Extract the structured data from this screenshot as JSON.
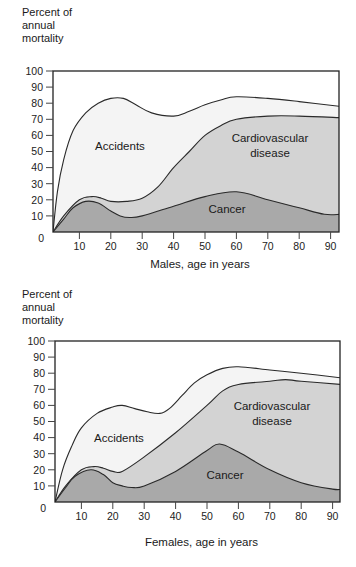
{
  "chart_data": [
    {
      "type": "area",
      "title": "",
      "ylabel": "Percent of annual mortality",
      "xlabel": "Males, age in years",
      "ylim": [
        0,
        100
      ],
      "xlim": [
        0,
        93
      ],
      "yticks": [
        0,
        10,
        20,
        30,
        40,
        50,
        60,
        70,
        80,
        90,
        100
      ],
      "xticks": [
        10,
        20,
        30,
        40,
        50,
        60,
        70,
        80,
        90
      ],
      "grid": false,
      "stacked": true,
      "colors": {
        "accidents": "#f4f4f4",
        "cardiovascular": "#d3d3d3",
        "cancer": "#a9a9a9",
        "line": "#2a2a2a"
      },
      "series": [
        {
          "name": "Accidents",
          "label_lines": [
            "Accidents"
          ],
          "x": [
            1.6,
            3,
            5,
            8,
            12,
            16,
            20,
            24,
            28,
            33,
            40,
            45,
            50,
            55,
            60,
            70,
            80,
            93
          ],
          "values": [
            0,
            25,
            45,
            63,
            74,
            80,
            83,
            83,
            79,
            74,
            72,
            75,
            79,
            82,
            84,
            83,
            81,
            78
          ]
        },
        {
          "name": "Cardiovascular disease",
          "label_lines": [
            "Cardiovascular",
            "disease"
          ],
          "x": [
            1.6,
            5,
            10,
            14,
            17,
            20,
            25,
            30,
            35,
            40,
            45,
            50,
            55,
            60,
            70,
            80,
            93
          ],
          "values": [
            0,
            10,
            20,
            22,
            21,
            19,
            19,
            21,
            28,
            40,
            50,
            60,
            66,
            70,
            72,
            72,
            71
          ]
        },
        {
          "name": "Cancer",
          "label_lines": [
            "Cancer"
          ],
          "x": [
            1.6,
            5,
            8,
            12,
            16,
            20,
            23,
            26,
            30,
            40,
            50,
            60,
            70,
            80,
            88,
            93
          ],
          "values": [
            0,
            8,
            15,
            19,
            18,
            13,
            10,
            9,
            10,
            16,
            22,
            25,
            20,
            15,
            11,
            11
          ]
        }
      ]
    },
    {
      "type": "area",
      "title": "",
      "ylabel": "Percent of annual mortality",
      "xlabel": "Females, age in years",
      "ylim": [
        0,
        100
      ],
      "xlim": [
        0,
        93
      ],
      "yticks": [
        0,
        10,
        20,
        30,
        40,
        50,
        60,
        70,
        80,
        90,
        100
      ],
      "xticks": [
        10,
        20,
        30,
        40,
        50,
        60,
        70,
        80,
        90
      ],
      "grid": false,
      "stacked": true,
      "colors": {
        "accidents": "#f4f4f4",
        "cardiovascular": "#d3d3d3",
        "cancer": "#a9a9a9",
        "line": "#2a2a2a"
      },
      "series": [
        {
          "name": "Accidents",
          "label_lines": [
            "Accidents"
          ],
          "x": [
            1.6,
            4,
            7,
            10,
            15,
            20,
            23,
            27,
            31,
            35,
            38,
            42,
            46,
            50,
            55,
            60,
            70,
            80,
            93
          ],
          "values": [
            0,
            20,
            35,
            46,
            55,
            59,
            60,
            58,
            56,
            55,
            58,
            66,
            74,
            79,
            83,
            84,
            82,
            80,
            77
          ]
        },
        {
          "name": "Cardiovascular disease",
          "label_lines": [
            "Cardiovascular",
            "disease"
          ],
          "x": [
            1.6,
            5,
            10,
            14,
            17,
            20,
            23,
            30,
            40,
            50,
            55,
            60,
            70,
            75,
            80,
            93
          ],
          "values": [
            0,
            10,
            20,
            22,
            21,
            19,
            19,
            28,
            43,
            60,
            69,
            73,
            75,
            76,
            75,
            73
          ]
        },
        {
          "name": "Cancer",
          "label_lines": [
            "Cancer"
          ],
          "x": [
            1.6,
            5,
            8,
            13,
            17,
            20,
            23,
            26,
            30,
            40,
            50,
            54,
            60,
            70,
            80,
            90,
            93
          ],
          "values": [
            0,
            9,
            16,
            20,
            17,
            12,
            10,
            9,
            10,
            19,
            32,
            36,
            31,
            20,
            12,
            8,
            8
          ]
        }
      ]
    }
  ],
  "charts": [
    {
      "ylabel_lines": [
        "Percent of",
        "annual",
        "mortality"
      ],
      "origin_label": "0",
      "xlabel": "Males, age in years",
      "labels": {
        "accidents": "Accidents",
        "cardio_1": "Cardiovascular",
        "cardio_2": "disease",
        "cancer": "Cancer"
      }
    },
    {
      "ylabel_lines": [
        "Percent of",
        "annual",
        "mortality"
      ],
      "origin_label": "0",
      "xlabel": "Females, age in years",
      "labels": {
        "accidents": "Accidents",
        "cardio_1": "Cardiovascular",
        "cardio_2": "disease",
        "cancer": "Cancer"
      }
    }
  ]
}
